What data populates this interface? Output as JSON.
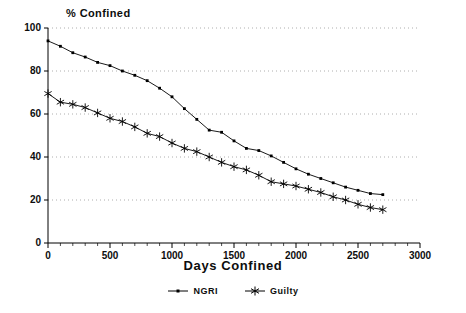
{
  "chart_data": {
    "type": "line",
    "title": "",
    "xlabel": "Days Confined",
    "ylabel": "% Confined",
    "xlim": [
      0,
      3000
    ],
    "ylim": [
      0,
      100
    ],
    "xticks": [
      0,
      500,
      1000,
      1500,
      2000,
      2500,
      3000
    ],
    "yticks": [
      0,
      20,
      40,
      60,
      80,
      100
    ],
    "xtick_labels": [
      "0",
      "500",
      "1000",
      "1500",
      "2000",
      "2500",
      "3000"
    ],
    "ytick_labels": [
      "0",
      "20",
      "40",
      "60",
      "80",
      "100"
    ],
    "grid": "horizontal-dotted",
    "legend_position": "bottom-center",
    "series": [
      {
        "name": "NGRI",
        "marker": "square-dot",
        "color": "#000000",
        "x": [
          0,
          100,
          200,
          300,
          400,
          500,
          600,
          700,
          800,
          900,
          1000,
          1100,
          1200,
          1300,
          1400,
          1500,
          1600,
          1700,
          1800,
          1900,
          2000,
          2100,
          2200,
          2300,
          2400,
          2500,
          2600,
          2700
        ],
        "values": [
          94.0,
          91.5,
          88.5,
          86.5,
          84.0,
          82.5,
          80.0,
          78.0,
          75.5,
          72.0,
          68.0,
          62.5,
          57.5,
          52.5,
          51.5,
          47.5,
          44.0,
          43.0,
          40.5,
          37.5,
          34.5,
          32.0,
          30.0,
          28.0,
          26.0,
          24.5,
          23.0,
          22.5
        ]
      },
      {
        "name": "Guilty",
        "marker": "asterisk",
        "color": "#000000",
        "x": [
          0,
          100,
          200,
          300,
          400,
          500,
          600,
          700,
          800,
          900,
          1000,
          1100,
          1200,
          1300,
          1400,
          1500,
          1600,
          1700,
          1800,
          1900,
          2000,
          2100,
          2200,
          2300,
          2400,
          2500,
          2600,
          2700
        ],
        "values": [
          69.5,
          65.5,
          64.5,
          63.0,
          60.5,
          58.0,
          56.5,
          54.0,
          51.0,
          49.5,
          46.5,
          44.0,
          42.5,
          40.0,
          37.5,
          35.5,
          34.0,
          31.5,
          28.5,
          27.5,
          26.5,
          25.0,
          23.5,
          21.5,
          20.0,
          18.0,
          16.5,
          15.5
        ]
      }
    ]
  },
  "legend": {
    "items": [
      {
        "label": "NGRI"
      },
      {
        "label": "Guilty"
      }
    ]
  }
}
